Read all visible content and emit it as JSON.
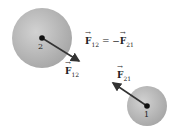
{
  "diagram": {
    "spheres": [
      {
        "id": "2",
        "label": "2",
        "cx": 42,
        "cy": 38,
        "r": 30
      },
      {
        "id": "1",
        "label": "1",
        "cx": 147,
        "cy": 106,
        "r": 20
      }
    ],
    "vectors": [
      {
        "name": "F12",
        "symbol": "F",
        "subscript": "12",
        "from": [
          42,
          38
        ],
        "to": [
          80,
          62
        ]
      },
      {
        "name": "F21",
        "symbol": "F",
        "subscript": "21",
        "from": [
          147,
          106
        ],
        "to": [
          112,
          82
        ]
      }
    ],
    "equation": {
      "lhs_symbol": "F",
      "lhs_sub": "12",
      "operator": " = −",
      "rhs_symbol": "F",
      "rhs_sub": "21"
    },
    "labels": {
      "f12_symbol": "F",
      "f12_sub": "12",
      "f21_symbol": "F",
      "f21_sub": "21",
      "sphere2": "2",
      "sphere1": "1"
    },
    "colors": {
      "sphere": "#b0b0b0",
      "arrow": "#333333",
      "dot": "#111111"
    }
  }
}
